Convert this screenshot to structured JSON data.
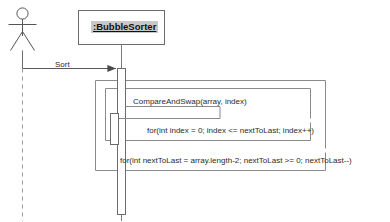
{
  "diagram": {
    "type": "uml-sequence-diagram",
    "background_color": "#ffffff",
    "line_color": "#555555",
    "text_color": "#2b2b2b",
    "highlight_color": "#c8c8c8"
  },
  "actor": {
    "name": "actor-stick-figure",
    "label": "",
    "lifeline_style": "dashed"
  },
  "object": {
    "label": ":BubbleSorter",
    "underlined": true,
    "selected": true,
    "lifeline_style": "solid"
  },
  "messages": [
    {
      "id": "sort",
      "label": "Sort",
      "kind": "call",
      "arrowhead": "solid-filled",
      "from": "actor",
      "to": "bubbleSorter"
    },
    {
      "id": "compareAndSwap",
      "label": "CompareAndSwap(array, index)",
      "kind": "self-call",
      "arrowhead": "open-line",
      "from": "bubbleSorter",
      "to": "bubbleSorter"
    }
  ],
  "loops": [
    {
      "id": "outer-loop",
      "label": "for(int nextToLast = array.length-2; nextToLast >= 0; nextToLast--)"
    },
    {
      "id": "inner-loop",
      "label": "for(int index = 0; index <= nextToLast; index++)"
    }
  ]
}
